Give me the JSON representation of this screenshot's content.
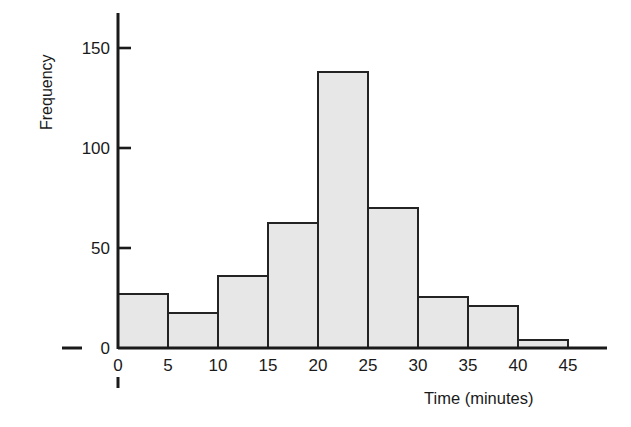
{
  "chart_data": {
    "type": "bar",
    "title": "",
    "subtitle": "",
    "xlabel": "Time (minutes)",
    "ylabel": "Frequency",
    "categories": [
      "0-5",
      "5-10",
      "10-15",
      "15-20",
      "20-25",
      "25-30",
      "30-35",
      "35-40",
      "40-45"
    ],
    "bin_edges": [
      0,
      5,
      10,
      15,
      20,
      25,
      30,
      35,
      40,
      45
    ],
    "values": [
      27,
      17.5,
      36,
      62.5,
      138,
      70,
      25.5,
      21,
      4
    ],
    "bin_width": 5,
    "xlim": [
      0,
      45
    ],
    "ylim": [
      0,
      160
    ],
    "xticks": [
      0,
      5,
      10,
      15,
      20,
      25,
      30,
      35,
      40,
      45
    ],
    "yticks": [
      0,
      50,
      100,
      150
    ],
    "xtick_labels": [
      "0",
      "5",
      "10",
      "15",
      "20",
      "25",
      "30",
      "35",
      "40",
      "45"
    ],
    "ytick_labels": [
      "0",
      "50",
      "100",
      "150"
    ],
    "grid": false,
    "legend": false,
    "legend_position": "none",
    "bar_fill_color": "#e7e7e7",
    "bar_edge_color": "#232323",
    "axis_color": "#1a1a1a",
    "background_color": "#ffffff"
  }
}
